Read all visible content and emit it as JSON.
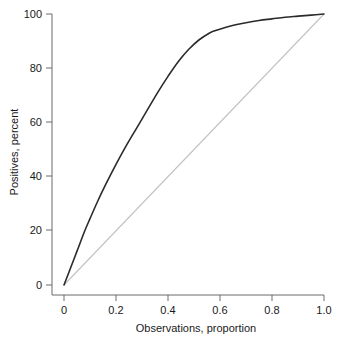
{
  "chart_data": {
    "type": "line",
    "title": "",
    "xlabel": "Observations, proportion",
    "ylabel": "Positives, percent",
    "xlim": [
      0,
      1.0
    ],
    "ylim": [
      0,
      100
    ],
    "grid": false,
    "legend": "none",
    "xticks": [
      "0",
      "0.2",
      "0.4",
      "0.6",
      "0.8",
      "1.0"
    ],
    "xtick_values": [
      0,
      0.2,
      0.4,
      0.6,
      0.8,
      1.0
    ],
    "yticks": [
      "0",
      "20",
      "40",
      "60",
      "80",
      "100"
    ],
    "ytick_values": [
      0,
      20,
      40,
      60,
      80,
      100
    ],
    "series": [
      {
        "name": "cumulative-gains-curve",
        "color": "#2b2b2b",
        "x": [
          0.0,
          0.02,
          0.05,
          0.08,
          0.1,
          0.13,
          0.16,
          0.2,
          0.24,
          0.28,
          0.32,
          0.36,
          0.4,
          0.44,
          0.48,
          0.52,
          0.56,
          0.58,
          0.62,
          0.66,
          0.7,
          0.75,
          0.8,
          0.85,
          0.9,
          0.95,
          1.0
        ],
        "y": [
          0.0,
          5.0,
          12.5,
          20.0,
          24.5,
          31.0,
          37.0,
          44.5,
          51.5,
          58.0,
          64.5,
          71.0,
          77.0,
          82.5,
          87.0,
          90.5,
          93.0,
          93.8,
          95.0,
          96.0,
          96.8,
          97.6,
          98.2,
          98.8,
          99.2,
          99.6,
          100.0
        ]
      },
      {
        "name": "reference-diagonal",
        "color": "#c2c2c2",
        "x": [
          0.0,
          1.0
        ],
        "y": [
          0.0,
          100.0
        ]
      }
    ]
  },
  "axes": {
    "x_title": "Observations, proportion",
    "y_title": "Positives, percent",
    "x_tick_labels": [
      "0",
      "0.2",
      "0.4",
      "0.6",
      "0.8",
      "1.0"
    ],
    "y_tick_labels": [
      "0",
      "20",
      "40",
      "60",
      "80",
      "100"
    ]
  },
  "colors": {
    "curve": "#2b2b2b",
    "reference": "#c2c2c2",
    "axis": "#6b6b6b",
    "text": "#1a1a1a",
    "background": "#ffffff"
  }
}
